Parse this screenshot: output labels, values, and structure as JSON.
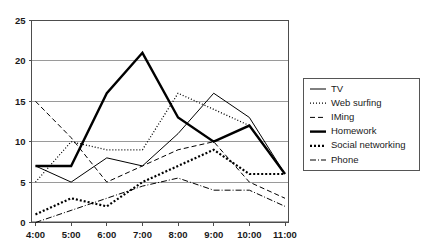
{
  "chart_data": {
    "type": "line",
    "title": "",
    "xlabel": "",
    "ylabel": "",
    "x": [
      "4:00",
      "5:00",
      "6:00",
      "7:00",
      "8:00",
      "9:00",
      "10:00",
      "11:00"
    ],
    "categories": [
      "4:00",
      "5:00",
      "6:00",
      "7:00",
      "8:00",
      "9:00",
      "10:00",
      "11:00"
    ],
    "ylim": [
      0,
      25
    ],
    "yticks": [
      0,
      5,
      10,
      15,
      20,
      25
    ],
    "ytick_labels": [
      "0",
      "5",
      "10",
      "15",
      "20",
      "25"
    ],
    "xtick_labels": [
      "4:00",
      "5:00",
      "6:00",
      "7:00",
      "8:00",
      "9:00",
      "10:00",
      "11:00"
    ],
    "grid": true,
    "grid_axis": "y",
    "legend_position": "right",
    "series": [
      {
        "name": "TV",
        "style": "solid-thin",
        "stroke_width": 1,
        "dash": "none",
        "color": "#000000",
        "values": [
          7,
          5,
          8,
          7,
          11,
          16,
          13,
          6
        ]
      },
      {
        "name": "Web surfing",
        "style": "fine-dotted",
        "stroke_width": 1.3,
        "dash": "1,2",
        "color": "#000000",
        "values": [
          5,
          10,
          9,
          9,
          16,
          14,
          12,
          6
        ]
      },
      {
        "name": "IMing",
        "style": "dashed",
        "stroke_width": 1,
        "dash": "5,3",
        "color": "#000000",
        "values": [
          15,
          10.5,
          5,
          7,
          9,
          10,
          5,
          3
        ]
      },
      {
        "name": "Homework",
        "style": "solid-thick",
        "stroke_width": 2.4,
        "dash": "none",
        "color": "#000000",
        "values": [
          7,
          7,
          16,
          21,
          13,
          10,
          12,
          6
        ]
      },
      {
        "name": "Social networking",
        "style": "thick-dotted",
        "stroke_width": 2.2,
        "dash": "2,2",
        "color": "#000000",
        "values": [
          1,
          3,
          2,
          5,
          7,
          9,
          6,
          6
        ]
      },
      {
        "name": "Phone",
        "style": "dash-dot",
        "stroke_width": 1,
        "dash": "6,2,1,2",
        "color": "#000000",
        "values": [
          0,
          1.5,
          3,
          4.5,
          5.5,
          4,
          4,
          2
        ]
      }
    ]
  },
  "legend": {
    "items": [
      {
        "label": "TV"
      },
      {
        "label": "Web surfing"
      },
      {
        "label": "IMing"
      },
      {
        "label": "Homework"
      },
      {
        "label": "Social networking"
      },
      {
        "label": "Phone"
      }
    ]
  },
  "colors": {
    "axis": "#4d4d4d",
    "grid": "#9a9a9a",
    "series": "#000000",
    "background": "#ffffff",
    "legend_border": "#555555"
  }
}
